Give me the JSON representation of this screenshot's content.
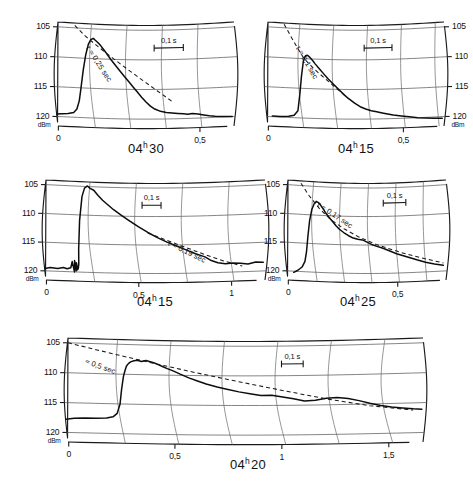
{
  "figure": {
    "name": "signal-strength-decay-recordings",
    "y_unit": "dBm",
    "y_ticks": [
      "105",
      "110",
      "115",
      "120"
    ],
    "scalebar_label": "0,1 s"
  },
  "panels": [
    {
      "id": "panel-04h30",
      "title_main": "04",
      "title_sup": "h",
      "title_tail": "30",
      "title_full": "04h30",
      "tau_label": "τ ≈ 0,25 sec",
      "tau_value": 0.25,
      "axis_side": "left",
      "x_ticks": [
        "0",
        "0,5"
      ],
      "x_tick_values": [
        0,
        0.5
      ],
      "y_unit": "dBm",
      "y_ticks": [
        "105",
        "110",
        "115",
        "120"
      ],
      "scalebar_label": "0,1 s"
    },
    {
      "id": "panel-04h15-top",
      "title_main": "04",
      "title_sup": "h",
      "title_tail": "15",
      "title_full": "04h15",
      "tau_label": "τ ≈ 0,1 sec",
      "tau_value": 0.1,
      "axis_side": "right",
      "x_ticks": [
        "0",
        "0,5"
      ],
      "x_tick_values": [
        0,
        0.5
      ],
      "y_unit": "dBm",
      "y_ticks": [
        "105",
        "110",
        "115",
        "120"
      ],
      "scalebar_label": "0,1 s"
    },
    {
      "id": "panel-04h15-mid",
      "title_main": "04",
      "title_sup": "h",
      "title_tail": "15",
      "title_full": "04h15",
      "tau_label": "τ ≈ 0,19 sec",
      "tau_value": 0.19,
      "axis_side": "left",
      "x_ticks": [
        "0",
        "0,5",
        "1"
      ],
      "x_tick_values": [
        0,
        0.5,
        1
      ],
      "y_unit": "dBm",
      "y_ticks": [
        "105",
        "110",
        "115",
        "120"
      ],
      "scalebar_label": "0,1 s"
    },
    {
      "id": "panel-04h25",
      "title_main": "04",
      "title_sup": "h",
      "title_tail": "25",
      "title_full": "04h25",
      "tau_label": "τ ≈ 0,17 sec",
      "tau_value": 0.17,
      "axis_side": "left",
      "x_ticks": [
        "0",
        "0,5"
      ],
      "x_tick_values": [
        0,
        0.5
      ],
      "y_unit": "dBm",
      "y_ticks": [
        "105",
        "110",
        "115",
        "120"
      ],
      "scalebar_label": "0,1 s"
    },
    {
      "id": "panel-04h20",
      "title_main": "04",
      "title_sup": "h",
      "title_tail": "20",
      "title_full": "04h20",
      "tau_label": "≈ 0,5 sec",
      "tau_value": 0.5,
      "axis_side": "left",
      "x_ticks": [
        "0",
        "0,5",
        "1",
        "1,5"
      ],
      "x_tick_values": [
        0,
        0.5,
        1,
        1.5
      ],
      "y_unit": "dBm",
      "y_ticks": [
        "105",
        "110",
        "115",
        "120"
      ],
      "scalebar_label": "0,1 s"
    }
  ],
  "chart_data": {
    "type": "line",
    "title": "",
    "xlabel": "time (s)",
    "ylabel": "dBm",
    "ylim": [
      105,
      122
    ],
    "y_inverted": true,
    "grid": true,
    "legend": "none",
    "note": "Five chart-recorder traces of received signal strength (dBm, axis inverted so 105 dBm is at top) versus time in seconds. Each panel carries a dashed exponential-decay fit annotated with its time constant tau, and a 0,1 s horizontal scale bar.",
    "panels": [
      {
        "name": "04h30",
        "xlim": [
          0,
          0.62
        ],
        "xticks": [
          0,
          0.5
        ],
        "tau_sec": 0.25,
        "annotation": "τ ≈ 0,25 sec",
        "scalebar_sec": 0.1,
        "series": [
          {
            "name": "recorded signal",
            "style": "solid",
            "x": [
              0.0,
              0.02,
              0.04,
              0.06,
              0.072,
              0.082,
              0.09,
              0.098,
              0.105,
              0.112,
              0.12,
              0.128,
              0.135,
              0.145,
              0.155,
              0.165,
              0.175,
              0.19,
              0.205,
              0.22,
              0.235,
              0.25,
              0.265,
              0.28,
              0.295,
              0.31,
              0.325,
              0.34,
              0.36,
              0.38,
              0.4,
              0.42,
              0.44,
              0.455,
              0.47,
              0.49,
              0.51,
              0.53,
              0.55,
              0.58,
              0.61
            ],
            "y": [
              119.6,
              119.5,
              119.4,
              119.2,
              118.6,
              117.2,
              115.0,
              112.0,
              109.4,
              107.6,
              106.8,
              106.6,
              106.9,
              107.3,
              107.8,
              108.4,
              109.0,
              110.0,
              110.9,
              111.8,
              112.7,
              113.6,
              114.5,
              115.4,
              116.3,
              117.1,
              117.8,
              118.3,
              118.7,
              118.9,
              119.0,
              119.1,
              119.2,
              119.3,
              119.2,
              119.3,
              119.5,
              119.7,
              119.8,
              119.9,
              120.0
            ]
          },
          {
            "name": "exponential fit",
            "style": "dashed",
            "x": [
              0.06,
              0.1,
              0.15,
              0.2,
              0.25,
              0.3,
              0.35,
              0.4
            ],
            "y": [
              104.6,
              106.3,
              108.1,
              109.9,
              111.7,
              113.5,
              115.3,
              117.1
            ]
          }
        ]
      },
      {
        "name": "04h15-top",
        "xlim": [
          0,
          0.65
        ],
        "xticks": [
          0,
          0.5
        ],
        "tau_sec": 0.1,
        "annotation": "τ ≈ 0,1 sec",
        "scalebar_sec": 0.1,
        "series": [
          {
            "name": "recorded signal",
            "style": "solid",
            "x": [
              0.02,
              0.05,
              0.08,
              0.1,
              0.115,
              0.125,
              0.132,
              0.138,
              0.145,
              0.152,
              0.16,
              0.17,
              0.18,
              0.195,
              0.21,
              0.225,
              0.24,
              0.255,
              0.27,
              0.285,
              0.3,
              0.32,
              0.34,
              0.36,
              0.38,
              0.4,
              0.42,
              0.44,
              0.46,
              0.49,
              0.52,
              0.55,
              0.58,
              0.61,
              0.64
            ],
            "y": [
              119.9,
              119.9,
              119.8,
              119.6,
              118.8,
              116.0,
              113.0,
              110.4,
              109.5,
              109.4,
              109.7,
              110.2,
              110.8,
              111.6,
              112.4,
              113.2,
              113.9,
              114.6,
              115.3,
              116.0,
              116.6,
              117.3,
              117.9,
              118.3,
              118.6,
              118.8,
              119.0,
              119.2,
              119.4,
              119.6,
              119.8,
              120.0,
              120.1,
              120.2,
              120.3
            ]
          },
          {
            "name": "exponential fit",
            "style": "dashed",
            "x": [
              0.06,
              0.1,
              0.14,
              0.18,
              0.22,
              0.26,
              0.3
            ],
            "y": [
              104.4,
              107.2,
              110.0,
              111.8,
              113.4,
              115.0,
              116.6
            ]
          }
        ]
      },
      {
        "name": "04h15-mid",
        "xlim": [
          0,
          1.18
        ],
        "xticks": [
          0,
          0.5,
          1
        ],
        "tau_sec": 0.19,
        "annotation": "τ ≈ 0,19 sec",
        "scalebar_sec": 0.1,
        "series": [
          {
            "name": "recorded signal",
            "style": "solid",
            "x": [
              0.0,
              0.03,
              0.07,
              0.1,
              0.12,
              0.14,
              0.15,
              0.158,
              0.163,
              0.168,
              0.172,
              0.176,
              0.18,
              0.184,
              0.188,
              0.194,
              0.2,
              0.21,
              0.225,
              0.24,
              0.26,
              0.285,
              0.31,
              0.34,
              0.37,
              0.41,
              0.45,
              0.5,
              0.55,
              0.6,
              0.65,
              0.7,
              0.75,
              0.8,
              0.85,
              0.88,
              0.92,
              0.96,
              1.0,
              1.04,
              1.08,
              1.12,
              1.16
            ],
            "y": [
              119.6,
              119.4,
              119.5,
              119.3,
              119.5,
              119.3,
              118.2,
              120.0,
              118.0,
              119.8,
              118.4,
              119.6,
              119.3,
              118.6,
              116.0,
              111.0,
              106.8,
              105.3,
              104.9,
              105.3,
              105.6,
              106.5,
              107.3,
              108.1,
              108.9,
              109.8,
              110.7,
              111.8,
              112.8,
              113.7,
              114.5,
              115.2,
              115.9,
              116.6,
              117.2,
              117.8,
              118.3,
              118.5,
              118.4,
              118.5,
              118.7,
              118.4,
              118.5
            ]
          },
          {
            "name": "exponential fit",
            "style": "dashed",
            "x": [
              0.55,
              0.65,
              0.75,
              0.85,
              0.95,
              1.05
            ],
            "y": [
              112.9,
              114.2,
              115.5,
              116.8,
              118.0,
              119.0
            ]
          }
        ]
      },
      {
        "name": "04h25",
        "xlim": [
          0,
          0.72
        ],
        "xticks": [
          0,
          0.5
        ],
        "tau_sec": 0.17,
        "annotation": "τ ≈ 0,17 sec",
        "scalebar_sec": 0.1,
        "series": [
          {
            "name": "recorded signal",
            "style": "solid",
            "x": [
              0.03,
              0.05,
              0.07,
              0.085,
              0.095,
              0.103,
              0.11,
              0.118,
              0.127,
              0.135,
              0.145,
              0.155,
              0.168,
              0.18,
              0.195,
              0.21,
              0.225,
              0.24,
              0.26,
              0.28,
              0.3,
              0.32,
              0.34,
              0.36,
              0.38,
              0.4,
              0.43,
              0.46,
              0.49,
              0.52,
              0.55,
              0.58,
              0.62,
              0.66,
              0.7
            ],
            "y": [
              120.2,
              119.8,
              119.2,
              118.2,
              116.4,
              113.8,
              111.0,
              109.0,
              108.0,
              107.6,
              107.8,
              108.2,
              108.9,
              109.6,
              110.3,
              111.0,
              111.7,
              112.3,
              112.9,
              113.4,
              113.8,
              114.0,
              114.1,
              114.5,
              114.9,
              115.2,
              115.6,
              116.1,
              116.6,
              117.0,
              117.4,
              117.8,
              118.3,
              118.7,
              119.0
            ]
          },
          {
            "name": "exponential fit",
            "style": "dashed",
            "x": [
              0.06,
              0.1,
              0.15,
              0.2,
              0.26,
              0.32,
              0.4,
              0.5,
              0.6,
              0.7
            ],
            "y": [
              104.6,
              106.6,
              108.8,
              110.6,
              112.2,
              113.5,
              114.9,
              116.3,
              117.5,
              118.6
            ]
          }
        ]
      },
      {
        "name": "04h20",
        "xlim": [
          0,
          1.66
        ],
        "xticks": [
          0,
          0.5,
          1,
          1.5
        ],
        "tau_sec": 0.5,
        "annotation": "≈ 0,5 sec",
        "scalebar_sec": 0.1,
        "series": [
          {
            "name": "recorded signal",
            "style": "solid",
            "x": [
              0.0,
              0.04,
              0.09,
              0.14,
              0.19,
              0.22,
              0.24,
              0.255,
              0.263,
              0.27,
              0.276,
              0.282,
              0.29,
              0.3,
              0.315,
              0.33,
              0.35,
              0.37,
              0.39,
              0.41,
              0.43,
              0.45,
              0.47,
              0.5,
              0.53,
              0.57,
              0.61,
              0.65,
              0.7,
              0.75,
              0.8,
              0.85,
              0.9,
              0.95,
              1.0,
              1.05,
              1.1,
              1.15,
              1.2,
              1.25,
              1.3,
              1.35,
              1.4,
              1.45,
              1.5,
              1.55,
              1.6,
              1.64
            ],
            "y": [
              117.8,
              117.6,
              117.5,
              117.5,
              117.4,
              117.2,
              116.6,
              115.0,
              112.5,
              110.4,
              109.4,
              108.6,
              108.2,
              107.9,
              107.7,
              107.6,
              107.8,
              107.6,
              107.8,
              108.0,
              108.3,
              108.6,
              108.9,
              109.3,
              109.8,
              110.4,
              110.9,
              111.4,
              111.9,
              112.3,
              112.7,
              113.0,
              113.3,
              113.3,
              113.6,
              113.9,
              114.3,
              114.2,
              113.9,
              113.8,
              114.0,
              114.4,
              114.9,
              115.3,
              115.6,
              115.8,
              116.0,
              116.1
            ]
          },
          {
            "name": "exponential fit",
            "style": "dashed",
            "x": [
              0.0,
              0.2,
              0.4,
              0.6,
              0.8,
              1.0,
              1.2,
              1.4,
              1.6
            ],
            "y": [
              105.0,
              106.5,
              108.0,
              109.5,
              111.0,
              112.5,
              114.0,
              115.3,
              116.2
            ]
          }
        ]
      }
    ]
  }
}
